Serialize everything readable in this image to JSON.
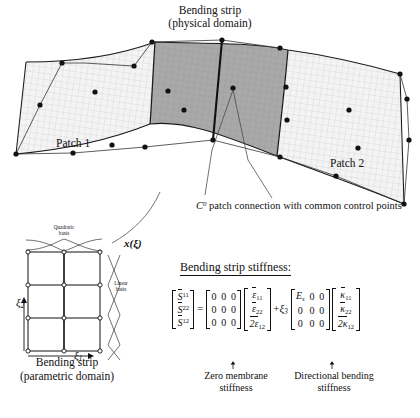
{
  "figure": {
    "title": "Bending strip\n(physical domain)",
    "title_line1": "Bending strip",
    "title_line2": "(physical domain)",
    "patch1_label": "Patch 1",
    "patch2_label": "Patch 2",
    "connection_note": "patch connection with common control points",
    "connection_symbol": "C",
    "connection_superscript": "0",
    "mapping_label": "x(ξ)"
  },
  "parametric": {
    "quadratic_basis_label": "Quadratic\nbasis",
    "quadratic_basis_l1": "Quadratic",
    "quadratic_basis_l2": "basis",
    "linear_basis_l1": "Linear",
    "linear_basis_l2": "basis",
    "axis_xi1": "ξ",
    "axis_xi1_sub": "1",
    "axis_xi2": "ξ",
    "axis_xi2_sub": "2",
    "caption_l1": "Bending strip",
    "caption_l2": "(parametric domain)",
    "grid_cols": 2,
    "grid_rows": 3
  },
  "equation": {
    "heading": "Bending strip stiffness:",
    "lhs": {
      "symbol": "S",
      "components": [
        "11",
        "22",
        "12"
      ]
    },
    "equals": "=",
    "membrane_matrix": [
      [
        "0",
        "0",
        "0"
      ],
      [
        "0",
        "0",
        "0"
      ],
      [
        "0",
        "0",
        "0"
      ]
    ],
    "strain_vector": [
      "ε",
      "ε",
      "2ε"
    ],
    "strain_subs": [
      "11",
      "22",
      "12"
    ],
    "plus": "+",
    "xi3": "ξ",
    "xi3_sub": "3",
    "bending_matrix": [
      [
        "E",
        "0",
        "0"
      ],
      [
        "0",
        "0",
        "0"
      ],
      [
        "0",
        "0",
        "0"
      ]
    ],
    "bending_E_sub": "s",
    "curvature_vector": [
      "κ",
      "κ",
      "2κ"
    ],
    "curvature_subs": [
      "11",
      "22",
      "12"
    ],
    "annotation_left_l1": "Zero membrane",
    "annotation_left_l2": "stiffness",
    "annotation_right_l1": "Directional bending",
    "annotation_right_l2": "stiffness",
    "arrow_glyph": "↑"
  },
  "colors": {
    "line": "#111111",
    "strip_fill": "#a8a8a8",
    "patch_fill": "#f2f2f2",
    "background": "#ffffff"
  }
}
